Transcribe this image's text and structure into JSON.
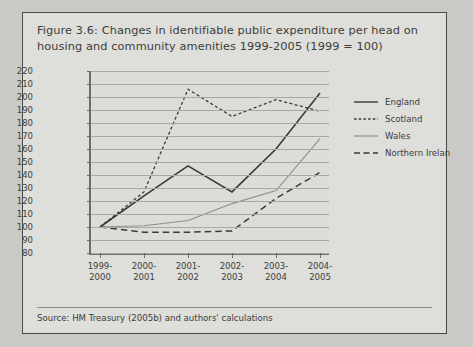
{
  "figure": {
    "title": "Figure 3.6: Changes in identifiable public expenditure per head on housing and community amenities 1999-2005 (1999 = 100)",
    "source": "Source: HM Treasury (2005b) and authors' calculations"
  },
  "chart_data": {
    "type": "line",
    "title": "Figure 3.6: Changes in identifiable public expenditure per head on housing and community amenities 1999-2005 (1999 = 100)",
    "xlabel": "",
    "ylabel": "",
    "categories": [
      "1999-2000",
      "2000-2001",
      "2001-2002",
      "2002-2003",
      "2003-2004",
      "2004-2005"
    ],
    "ylim": [
      80,
      220
    ],
    "ytick_step": 10,
    "yticks": [
      220,
      210,
      200,
      190,
      180,
      170,
      160,
      150,
      140,
      130,
      120,
      110,
      100,
      90,
      80
    ],
    "grid": true,
    "legend_position": "right",
    "series": [
      {
        "name": "England",
        "style": "solid",
        "color": "#3a3a38",
        "values": [
          100,
          124,
          147,
          127,
          160,
          203
        ]
      },
      {
        "name": "Scotland",
        "style": "dotted",
        "color": "#3a3a38",
        "values": [
          100,
          127,
          206,
          185,
          198,
          189
        ]
      },
      {
        "name": "Wales",
        "style": "solid-light",
        "color": "#8f8f8c",
        "values": [
          100,
          101,
          105,
          118,
          128,
          168
        ]
      },
      {
        "name": "Northern Ireland",
        "style": "dashed",
        "color": "#3a3a38",
        "values": [
          100,
          96,
          96,
          97,
          122,
          142
        ]
      }
    ]
  },
  "legend": {
    "items": [
      {
        "label": "England"
      },
      {
        "label": "Scotland"
      },
      {
        "label": "Wales"
      },
      {
        "label": "Northern Irelan"
      }
    ]
  }
}
